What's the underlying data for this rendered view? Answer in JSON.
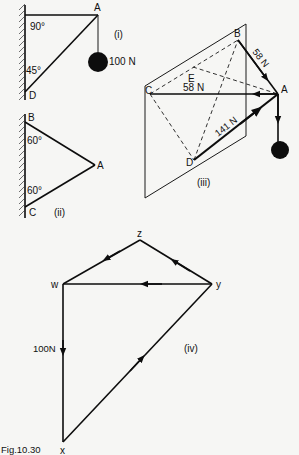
{
  "figure": {
    "caption": "Fig.10.30",
    "panel_i": {
      "tag": "(i)",
      "point_a": "A",
      "point_d": "D",
      "angle_top": "90°",
      "angle_bottom": "45°",
      "load": "100 N"
    },
    "panel_ii": {
      "tag": "(ii)",
      "point_a": "A",
      "point_b": "B",
      "point_c": "C",
      "angle_top": "60°",
      "angle_bottom": "60°"
    },
    "panel_iii": {
      "tag": "(iii)",
      "point_a": "A",
      "point_b": "B",
      "point_c": "C",
      "point_d": "D",
      "point_e": "E",
      "force_ab": "58 N",
      "force_ac": "58 N",
      "force_ad": "141 N"
    },
    "panel_iv": {
      "tag": "(iv)",
      "point_w": "w",
      "point_x": "x",
      "point_y": "y",
      "point_z": "z",
      "load": "100N"
    }
  },
  "colors": {
    "ink": "#0d0d0d",
    "paper": "#f6f6f4"
  }
}
